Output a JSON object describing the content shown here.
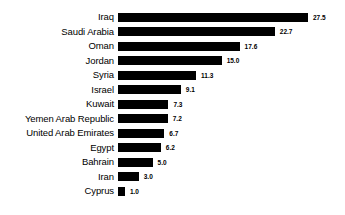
{
  "chart_data": {
    "type": "bar",
    "orientation": "horizontal",
    "title": "",
    "subtitle": "",
    "xlabel": "",
    "ylabel": "",
    "grid": false,
    "legend": "none",
    "xlim": [
      0,
      27.5
    ],
    "bar_color": "#000000",
    "background_color": "#ffffff",
    "categories": [
      "Iraq",
      "Saudi Arabia",
      "Oman",
      "Jordan",
      "Syria",
      "Israel",
      "Kuwait",
      "Yemen Arab Republic",
      "United Arab Emirates",
      "Egypt",
      "Bahrain",
      "Iran",
      "Cyprus"
    ],
    "values": [
      27.5,
      22.7,
      17.6,
      15.0,
      11.3,
      9.1,
      7.3,
      7.2,
      6.7,
      6.2,
      5.0,
      3.0,
      1.0
    ],
    "value_labels": [
      "27.5",
      "22.7",
      "17.6",
      "15.0",
      "11.3",
      "9.1",
      "7.3",
      "7.2",
      "6.7",
      "6.2",
      "5.0",
      "3.0",
      "1.0"
    ]
  }
}
